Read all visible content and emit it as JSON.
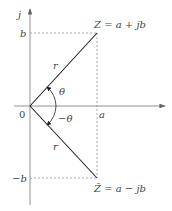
{
  "diagram": {
    "axes": {
      "vertical_label": "j",
      "origin_label": "0",
      "x_tick_label": "a",
      "y_pos_tick_label": "b",
      "y_neg_tick_label": "−b"
    },
    "points": {
      "z_label": "Z = a + jb",
      "zbar_label": "Z̄ = a − jb"
    },
    "vectors": {
      "upper_magnitude_label": "r",
      "lower_magnitude_label": "r"
    },
    "angles": {
      "positive_label": "θ",
      "negative_label": "−θ"
    },
    "colors": {
      "line": "#222222",
      "axis": "#555555",
      "dashed": "#888888",
      "text": "#444444"
    }
  }
}
